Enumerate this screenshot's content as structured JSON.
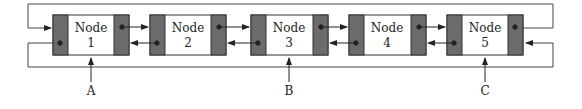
{
  "diagram": {
    "type": "circular doubly linked list",
    "nodes": [
      {
        "title": "Node",
        "num": "1"
      },
      {
        "title": "Node",
        "num": "2"
      },
      {
        "title": "Node",
        "num": "3"
      },
      {
        "title": "Node",
        "num": "4"
      },
      {
        "title": "Node",
        "num": "5"
      }
    ],
    "pointers": [
      {
        "label": "A",
        "target": "Node 1"
      },
      {
        "label": "B",
        "target": "Node 3"
      },
      {
        "label": "C",
        "target": "Node 5"
      }
    ],
    "colors": {
      "pointer_cell": "#6b6b6b",
      "line": "#333333",
      "node_body": "#ffffff"
    }
  }
}
